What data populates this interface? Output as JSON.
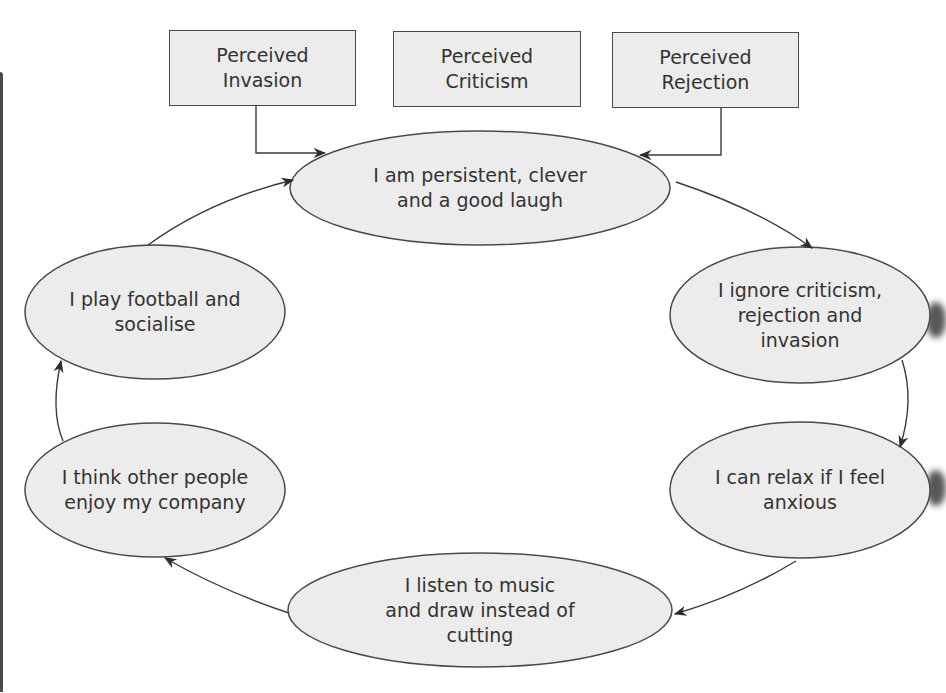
{
  "diagram": {
    "type": "cycle-with-inputs",
    "colors": {
      "node_fill": "#ececec",
      "stroke": "#4a4a4a",
      "text": "#333333",
      "background": "#ffffff"
    },
    "inputs": [
      {
        "id": "invasion",
        "label": "Perceived\nInvasion",
        "connects_to": "core"
      },
      {
        "id": "criticism",
        "label": "Perceived\nCriticism",
        "connects_to": null
      },
      {
        "id": "rejection",
        "label": "Perceived\nRejection",
        "connects_to": "core"
      }
    ],
    "core": {
      "id": "core",
      "label": "I am persistent, clever\nand a good laugh"
    },
    "cycle": [
      {
        "id": "core",
        "label": "I am persistent, clever\nand a good laugh"
      },
      {
        "id": "ignore",
        "label": "I ignore criticism,\nrejection and\ninvasion"
      },
      {
        "id": "relax",
        "label": "I can relax if I feel\nanxious"
      },
      {
        "id": "music",
        "label": "I listen to music\nand draw instead of\ncutting"
      },
      {
        "id": "enjoy",
        "label": "I think other people\nenjoy my company"
      },
      {
        "id": "football",
        "label": "I play football and\nsocialise"
      }
    ],
    "cycle_direction": "clockwise"
  }
}
